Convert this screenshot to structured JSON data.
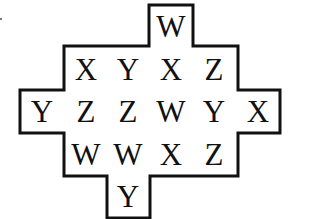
{
  "puzzle": {
    "rows": [
      {
        "cells": [
          {
            "letter": "W",
            "x": 171,
            "y": 27
          }
        ]
      },
      {
        "cells": [
          {
            "letter": "X",
            "x": 86,
            "y": 70
          },
          {
            "letter": "Y",
            "x": 128,
            "y": 70
          },
          {
            "letter": "X",
            "x": 171,
            "y": 70
          },
          {
            "letter": "Z",
            "x": 214,
            "y": 70
          }
        ]
      },
      {
        "cells": [
          {
            "letter": "Y",
            "x": 42,
            "y": 112
          },
          {
            "letter": "Z",
            "x": 86,
            "y": 112
          },
          {
            "letter": "Z",
            "x": 128,
            "y": 112
          },
          {
            "letter": "W",
            "x": 171,
            "y": 112
          },
          {
            "letter": "Y",
            "x": 214,
            "y": 112
          },
          {
            "letter": "X",
            "x": 258,
            "y": 112
          }
        ]
      },
      {
        "cells": [
          {
            "letter": "W",
            "x": 86,
            "y": 155
          },
          {
            "letter": "W",
            "x": 128,
            "y": 155
          },
          {
            "letter": "X",
            "x": 171,
            "y": 155
          },
          {
            "letter": "Z",
            "x": 214,
            "y": 155
          }
        ]
      },
      {
        "cells": [
          {
            "letter": "Y",
            "x": 128,
            "y": 197
          }
        ]
      }
    ],
    "outline_color": "#111111",
    "letter_color": "#111111"
  }
}
